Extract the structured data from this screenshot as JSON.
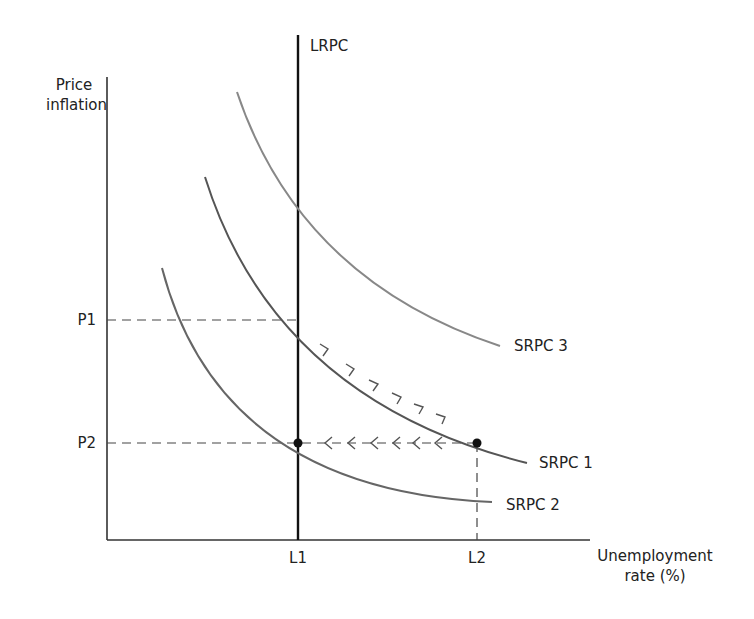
{
  "diagram": {
    "y_axis_label": [
      "Price",
      "inflation"
    ],
    "x_axis_label": [
      "Unemployment",
      "rate (%)"
    ],
    "ticks": {
      "y": [
        "P1",
        "P2"
      ],
      "x": [
        "L1",
        "L2"
      ]
    },
    "curves": [
      {
        "id": "LRPC",
        "label": "LRPC",
        "type": "vertical",
        "color": "#111111"
      },
      {
        "id": "SRPC1",
        "label": "SRPC 1",
        "color": "#555555"
      },
      {
        "id": "SRPC2",
        "label": "SRPC 2",
        "color": "#666666"
      },
      {
        "id": "SRPC3",
        "label": "SRPC 3",
        "color": "#888888"
      }
    ],
    "points": [
      {
        "label": "L1,P2",
        "x": "L1",
        "y": "P2"
      },
      {
        "label": "L2,P2",
        "x": "L2",
        "y": "P2"
      }
    ],
    "arrows": [
      {
        "description": "movement down along SRPC 1 from (L1,P1) to (L2,P2)",
        "count": 6
      },
      {
        "description": "movement left from (L2,P2) to (L1,P2) along dashed line",
        "count": 6
      }
    ]
  }
}
